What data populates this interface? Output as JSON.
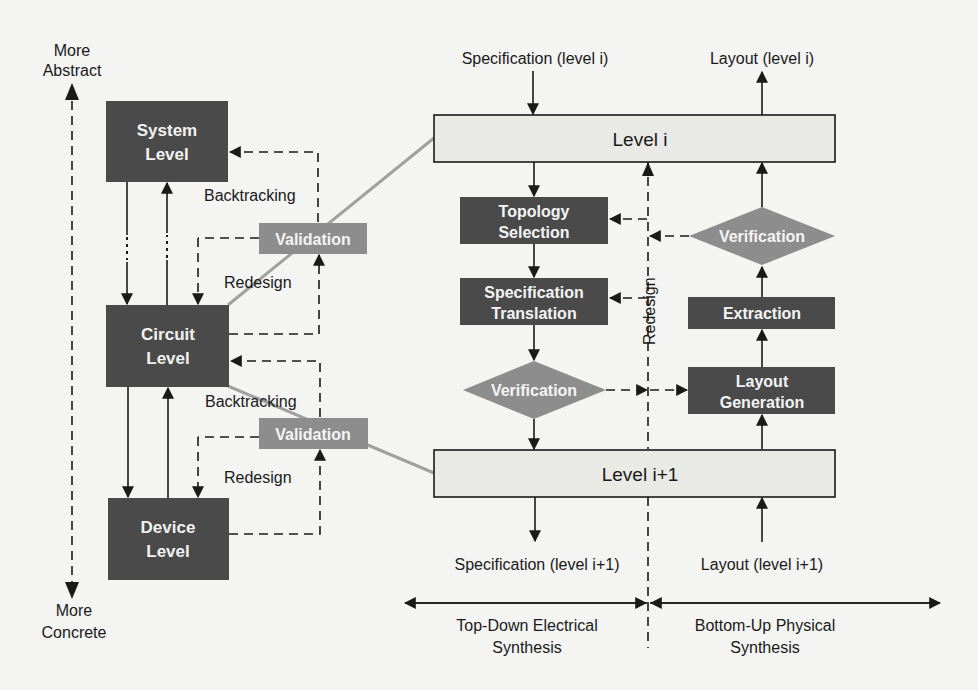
{
  "axis": {
    "top_label_line1": "More",
    "top_label_line2": "Abstract",
    "bottom_label_line1": "More",
    "bottom_label_line2": "Concrete"
  },
  "hierarchy": {
    "system": {
      "line1": "System",
      "line2": "Level"
    },
    "circuit": {
      "line1": "Circuit",
      "line2": "Level"
    },
    "device": {
      "line1": "Device",
      "line2": "Level"
    },
    "validation_upper": "Validation",
    "validation_lower": "Validation",
    "backtracking_upper": "Backtracking",
    "backtracking_lower": "Backtracking",
    "redesign_upper": "Redesign",
    "redesign_lower": "Redesign"
  },
  "detail": {
    "spec_in": "Specification (level i)",
    "layout_out": "Layout (level i)",
    "level_i": "Level i",
    "level_i1": "Level i+1",
    "topology": {
      "line1": "Topology",
      "line2": "Selection"
    },
    "spec_translation": {
      "line1": "Specification",
      "line2": "Translation"
    },
    "verification_left": "Verification",
    "verification_right": "Verification",
    "extraction": "Extraction",
    "layout_generation": {
      "line1": "Layout",
      "line2": "Generation"
    },
    "redesign": "Redesign",
    "spec_out": "Specification (level i+1)",
    "layout_in": "Layout (level i+1)",
    "top_down": {
      "line1": "Top-Down Electrical",
      "line2": "Synthesis"
    },
    "bottom_up": {
      "line1": "Bottom-Up Physical",
      "line2": "Synthesis"
    }
  },
  "colors": {
    "dark_box": "#4a4a4a",
    "mid_box": "#8d8d8d",
    "level_box": "#e9e9e6",
    "connector_gray": "#a0a0a0",
    "ink": "#1a1a1a"
  }
}
